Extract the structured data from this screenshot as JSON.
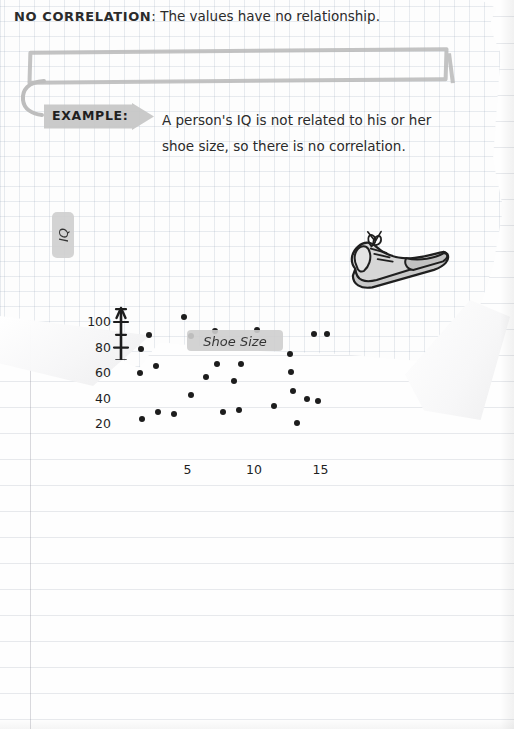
{
  "page": {
    "background_type": "lined-notebook-paper",
    "overlay_type": "torn-graph-paper-sheet"
  },
  "banner": {
    "keyword": "NO CORRELATION",
    "separator": ":",
    "definition": "The values have no relationship."
  },
  "example": {
    "tag_label": "EXAMPLE:",
    "line1": "A person's IQ is not related to his or her",
    "line2": "shoe size, so there is no correlation."
  },
  "illustration": {
    "name": "sneaker-shoe",
    "fill_color": "#c9c9c9",
    "outline_color": "#1f1f1f"
  },
  "chart_data": {
    "type": "scatter",
    "title": "",
    "xlabel": "Shoe Size",
    "ylabel": "IQ",
    "xlim": [
      0,
      16.5
    ],
    "ylim": [
      0,
      112
    ],
    "xticks": [
      5,
      10,
      15
    ],
    "xtick_labels": [
      "5",
      "10",
      "15"
    ],
    "xminor_ticks": [
      2.5,
      7.5,
      12.5
    ],
    "yticks": [
      20,
      40,
      60,
      80,
      100
    ],
    "ytick_labels": [
      "20",
      "40",
      "60",
      "80",
      "100"
    ],
    "yminor_ticks": [
      10,
      30,
      50,
      70,
      90,
      110
    ],
    "grid": false,
    "axis_style": "hand-drawn-arrows",
    "legend": null,
    "correlation": "none",
    "points": [
      {
        "x": 1.6,
        "y": 24
      },
      {
        "x": 2.1,
        "y": 90
      },
      {
        "x": 1.5,
        "y": 79
      },
      {
        "x": 2.6,
        "y": 66
      },
      {
        "x": 1.4,
        "y": 60
      },
      {
        "x": 2.8,
        "y": 30
      },
      {
        "x": 4.0,
        "y": 28
      },
      {
        "x": 4.7,
        "y": 104
      },
      {
        "x": 5.3,
        "y": 89
      },
      {
        "x": 5.3,
        "y": 43
      },
      {
        "x": 6.4,
        "y": 57
      },
      {
        "x": 7.1,
        "y": 93
      },
      {
        "x": 7.2,
        "y": 67
      },
      {
        "x": 7.7,
        "y": 30
      },
      {
        "x": 8.5,
        "y": 54
      },
      {
        "x": 8.9,
        "y": 31
      },
      {
        "x": 9.0,
        "y": 67
      },
      {
        "x": 10.2,
        "y": 94
      },
      {
        "x": 11.5,
        "y": 34
      },
      {
        "x": 12.7,
        "y": 75
      },
      {
        "x": 12.8,
        "y": 61
      },
      {
        "x": 12.9,
        "y": 46
      },
      {
        "x": 13.2,
        "y": 21
      },
      {
        "x": 14.0,
        "y": 40
      },
      {
        "x": 14.5,
        "y": 91
      },
      {
        "x": 14.8,
        "y": 38
      },
      {
        "x": 15.5,
        "y": 91
      }
    ]
  }
}
